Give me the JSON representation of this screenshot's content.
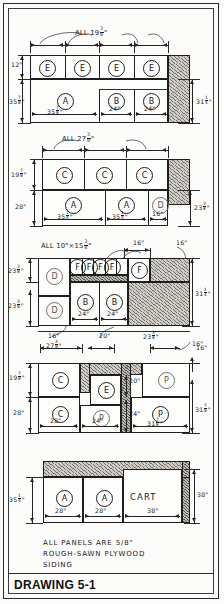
{
  "drawing": {
    "title": "DRAWING 5-1",
    "note_line_1": "ALL PANELS ARE 5/8\"",
    "note_line_2": "ROUGH-SAWN PLYWOOD",
    "note_line_3": "SIDING"
  },
  "sheets": [
    {
      "id": "sheet-1",
      "top_label": "ALL 19 3/8\"",
      "left_dims": [
        "12\"",
        "35 7/8\""
      ],
      "right_dims": [
        "31 1/4\""
      ],
      "panels": [
        {
          "label": "E"
        },
        {
          "label": "E"
        },
        {
          "label": "E"
        },
        {
          "label": "E"
        },
        {
          "label": "A"
        },
        {
          "label": "B"
        },
        {
          "label": "B"
        }
      ],
      "bottom_dims": [
        "35 7/8\"",
        "24\"",
        "24\""
      ]
    },
    {
      "id": "sheet-2",
      "top_label": "ALL 27 3/8\"",
      "left_dims": [
        "19 7/8\"",
        "28\""
      ],
      "right_dims": [
        "23 3/8\""
      ],
      "panels": [
        {
          "label": "C"
        },
        {
          "label": "C"
        },
        {
          "label": "C"
        },
        {
          "label": "A"
        },
        {
          "label": "A"
        },
        {
          "label": "D"
        }
      ],
      "bottom_dims": [
        "35 1/4\"",
        "35 1/4\"",
        "16\""
      ]
    },
    {
      "id": "sheet-3",
      "top_label": "ALL 10\" x 15 3/8\"",
      "top_dims": [
        "16\"",
        "16\""
      ],
      "left_dims": [
        "23 3/8\"",
        "23 3/8\""
      ],
      "right_dims": [
        "31 1/4\""
      ],
      "panels": [
        {
          "label": "D"
        },
        {
          "label": "F"
        },
        {
          "label": "F"
        },
        {
          "label": "F"
        },
        {
          "label": "F"
        },
        {
          "label": "F"
        },
        {
          "label": "D"
        },
        {
          "label": "B"
        },
        {
          "label": "B"
        }
      ],
      "bottom_dims": [
        "24\"",
        "24\"",
        "16\"",
        "20\"",
        "23 3/8\""
      ],
      "lower_dims": [
        "27 3/8\"",
        "16\""
      ]
    },
    {
      "id": "sheet-4",
      "left_dims": [
        "19 7/8\"",
        "28\""
      ],
      "right_dims": [
        "31 7/8\"",
        "16\""
      ],
      "panels": [
        {
          "label": "C"
        },
        {
          "label": "E"
        },
        {
          "label": "P"
        },
        {
          "label": "C"
        },
        {
          "label": "P"
        },
        {
          "label": "P"
        }
      ],
      "inner_dims": [
        "20\"",
        "24\""
      ],
      "bottom_dims": [
        "28\"",
        "24\"",
        "31 7/8\""
      ]
    },
    {
      "id": "sheet-5",
      "left_dims": [
        "35 1/4\""
      ],
      "right_dims": [
        "38\""
      ],
      "panels": [
        {
          "label": "A"
        },
        {
          "label": "A"
        },
        {
          "label": "CART"
        }
      ],
      "bottom_dims": [
        "28\"",
        "28\"",
        "38\""
      ]
    }
  ]
}
